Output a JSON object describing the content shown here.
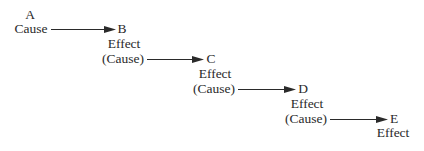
{
  "diagram": {
    "title": "",
    "nodes": [
      {
        "id": "A",
        "letter": "A",
        "roles": [
          "Cause"
        ]
      },
      {
        "id": "B",
        "letter": "B",
        "roles": [
          "Effect",
          "(Cause)"
        ]
      },
      {
        "id": "C",
        "letter": "C",
        "roles": [
          "Effect",
          "(Cause)"
        ]
      },
      {
        "id": "D",
        "letter": "D",
        "roles": [
          "Effect",
          "(Cause)"
        ]
      },
      {
        "id": "E",
        "letter": "E",
        "roles": [
          "Effect"
        ]
      }
    ],
    "edges": [
      {
        "from": "A",
        "to": "B"
      },
      {
        "from": "B",
        "to": "C"
      },
      {
        "from": "C",
        "to": "D"
      },
      {
        "from": "D",
        "to": "E"
      }
    ],
    "colors": {
      "text": "#2a2a2a",
      "arrow": "#2a2a2a",
      "background": "#ffffff"
    }
  }
}
